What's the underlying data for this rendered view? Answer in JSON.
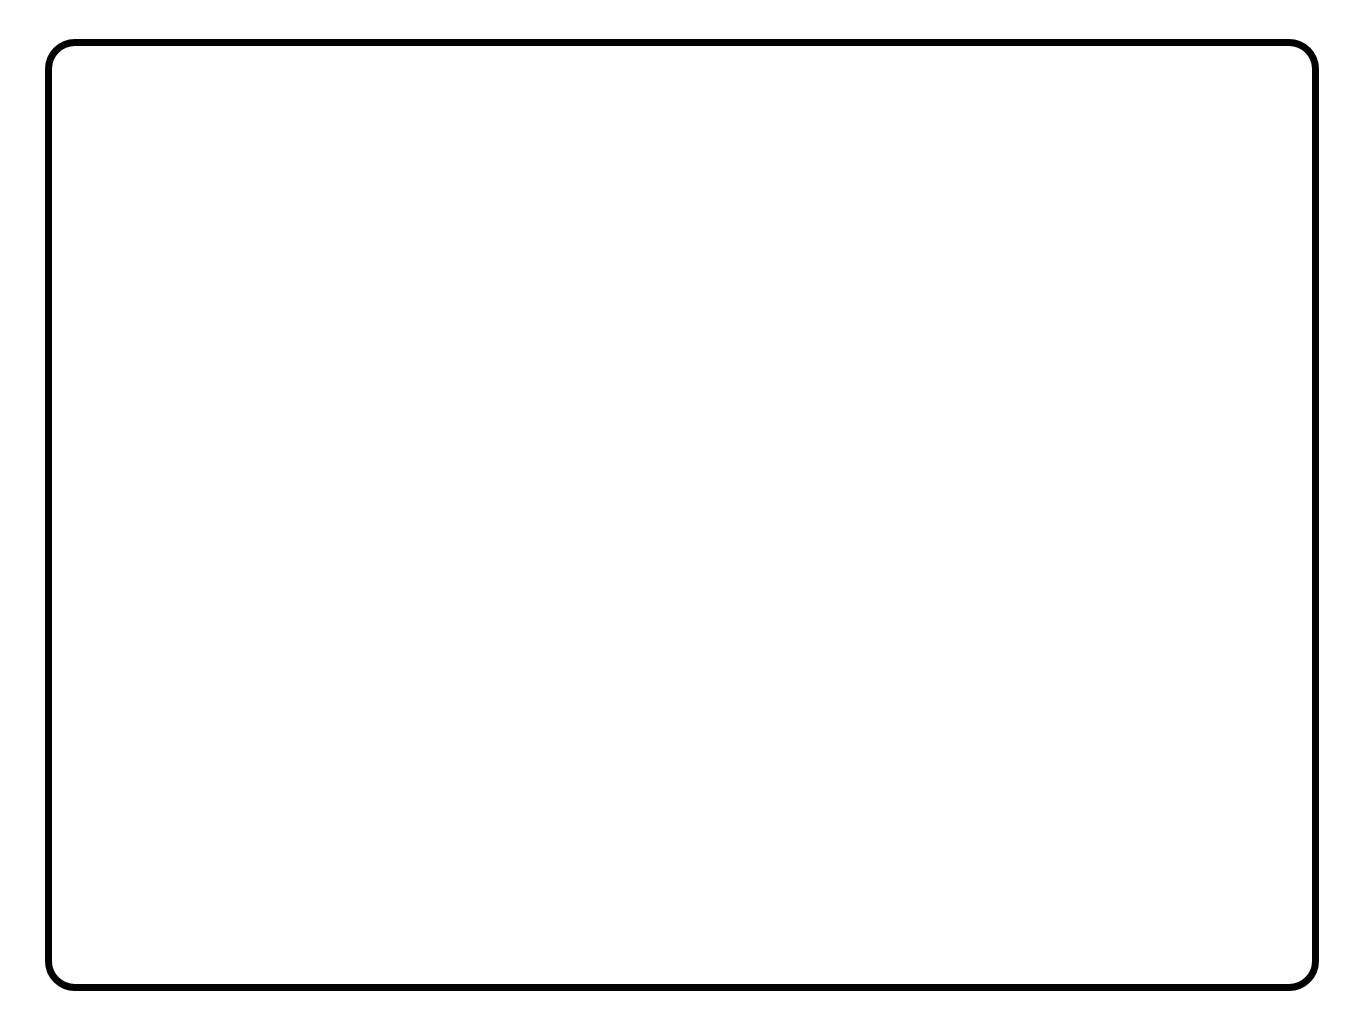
{
  "page": {
    "background_color": "#ffffff",
    "ink_color": "#111111",
    "frame_color": "#000000",
    "rule_color": "#8a8a8a",
    "columns": 3,
    "rows": 2
  },
  "panels": [
    {
      "number": "1",
      "row": 0,
      "col": 0,
      "figure": {
        "type": "hash-grid",
        "vertical_lines": 4,
        "horizontal_lines": 4,
        "total_lines": 8,
        "x": 75,
        "y": 110,
        "width": 238,
        "height": 238,
        "overhang": 40
      }
    },
    {
      "number": "2",
      "row": 0,
      "col": 1,
      "figure": {
        "type": "hash-grid",
        "vertical_lines": 3,
        "horizontal_lines": 5,
        "total_lines": 8,
        "x": 120,
        "y": 140,
        "width": 170,
        "height": 252,
        "overhang": 40
      }
    },
    {
      "number": "3",
      "row": 0,
      "col": 2,
      "figure": {
        "type": "hash-grid",
        "vertical_lines": 4,
        "horizontal_lines": 6,
        "total_lines": 10,
        "x": 90,
        "y": 100,
        "width": 190,
        "height": 300,
        "overhang": 40
      }
    },
    {
      "number": "4",
      "row": 1,
      "col": 0,
      "figure": {
        "type": "hash-grid",
        "vertical_lines": 1,
        "horizontal_lines": 2,
        "total_lines": 3,
        "x": 186,
        "y": 180,
        "width": 0,
        "height": 50,
        "overhang": 50
      }
    },
    {
      "number": "5",
      "row": 1,
      "col": 1,
      "figure": {
        "type": "hash-grid",
        "vertical_lines": 6,
        "horizontal_lines": 5,
        "total_lines": 11,
        "x": 60,
        "y": 75,
        "width": 290,
        "height": 240,
        "overhang": 40
      }
    },
    {
      "number": "6",
      "row": 1,
      "col": 2,
      "figure": {
        "type": "hash-grid",
        "vertical_lines": 4,
        "horizontal_lines": 5,
        "total_lines": 9,
        "x": 90,
        "y": 90,
        "width": 190,
        "height": 240,
        "overhang": 40
      }
    }
  ]
}
